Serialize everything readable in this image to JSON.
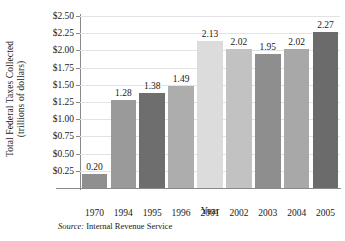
{
  "chart_data": {
    "type": "bar",
    "title": "",
    "xlabel": "Year",
    "ylabel": "Total Federal Taxes Collected (trillions of dollars)",
    "ylabel_line1": "Total Federal Taxes Collected",
    "ylabel_line2": "(trillions of dollars)",
    "categories": [
      "1970",
      "1994",
      "1995",
      "1996",
      "2001",
      "2002",
      "2003",
      "2004",
      "2005"
    ],
    "values": [
      0.2,
      1.28,
      1.38,
      1.49,
      2.13,
      2.02,
      1.95,
      2.02,
      2.27
    ],
    "value_labels": [
      "0.20",
      "1.28",
      "1.38",
      "1.49",
      "2.13",
      "2.02",
      "1.95",
      "2.02",
      "2.27"
    ],
    "bar_colors": [
      "#8f8f8f",
      "#9a9a9a",
      "#6e6e6e",
      "#adadad",
      "#dcdcdc",
      "#c2c2c2",
      "#8e8e8e",
      "#a8a8a8",
      "#6b6b6b"
    ],
    "ylim": [
      0.0,
      2.5
    ],
    "ytick_values": [
      0.25,
      0.5,
      0.75,
      1.0,
      1.25,
      1.5,
      1.75,
      2.0,
      2.25,
      2.5
    ],
    "ytick_labels": [
      "$0.25",
      "$0.50",
      "$0.75",
      "$1.00",
      "$1.25",
      "$1.50",
      "$1.75",
      "$2.00",
      "$2.25",
      "$2.50"
    ],
    "grid": true,
    "grid_axis": "y",
    "legend": false
  },
  "source": {
    "label": "Source:",
    "text": " Internal Revenue Service"
  }
}
